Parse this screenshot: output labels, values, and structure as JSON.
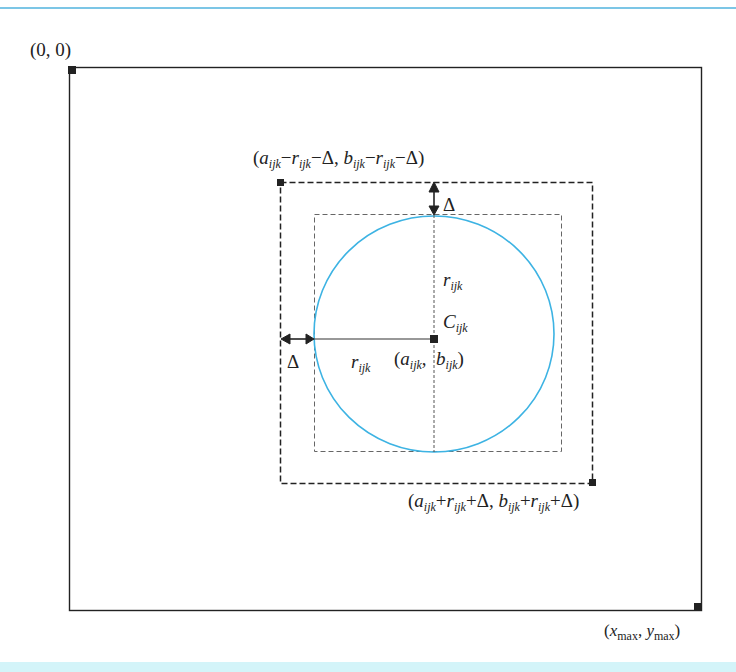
{
  "colors": {
    "top_rule": "#7cc6e6",
    "bottom_band": "#d3f4f9",
    "circle": "#3db3e3",
    "frame": "#222222"
  },
  "labels": {
    "origin": "(0, 0)",
    "max_corner": {
      "x": "x",
      "x_sub": "max",
      "y": "y",
      "y_sub": "max"
    },
    "outer_top_left": "(a_ijk − r_ijk − Δ, b_ijk − r_ijk − Δ)",
    "outer_bottom_right": "(a_ijk + r_ijk + Δ, b_ijk + r_ijk + Δ)",
    "center_name": "C_ijk",
    "center_coords": "(a_ijk, b_ijk)",
    "radius_vertical": "r_ijk",
    "radius_horizontal": "r_ijk",
    "delta_top": "Δ",
    "delta_left": "Δ"
  }
}
